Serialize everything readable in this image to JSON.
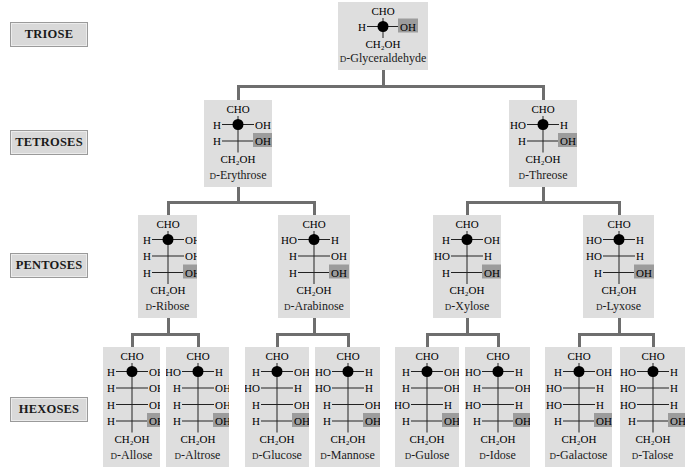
{
  "levels": [
    {
      "label": "TRIOSE",
      "top": 22
    },
    {
      "label": "TETROSES",
      "top": 130
    },
    {
      "label": "PENTOSES",
      "top": 253
    },
    {
      "label": "HEXOSES",
      "top": 397
    }
  ],
  "formula": {
    "top_group": "CHO",
    "bottom_group": "CH2OH",
    "bottom_group_display": "CH₂OH",
    "hydroxyl": "OH",
    "hydrogen": "H",
    "hydroxyl_left": "HO"
  },
  "colors": {
    "box_fill": "#dedede",
    "highlight_fill": "#9c9c9c",
    "connector": "#6e6e6e",
    "label_fill": "#d9d9d9",
    "stereocenter_dot": "#000000"
  },
  "sugars": [
    {
      "id": "glyceraldehyde",
      "prefix": "D",
      "name": "-Glyceraldehyde",
      "level": "TRIOSE",
      "x": 338,
      "y": 2,
      "w": 90,
      "h": 68,
      "carbons": [
        [
          "H",
          "OH"
        ]
      ]
    },
    {
      "id": "erythrose",
      "prefix": "D",
      "name": "-Erythrose",
      "level": "TETROSES",
      "x": 204,
      "y": 100,
      "w": 68,
      "h": 87,
      "carbons": [
        [
          "H",
          "OH"
        ],
        [
          "H",
          "OH"
        ]
      ]
    },
    {
      "id": "threose",
      "prefix": "D",
      "name": "-Threose",
      "level": "TETROSES",
      "x": 509,
      "y": 100,
      "w": 68,
      "h": 87,
      "carbons": [
        [
          "HO",
          "H"
        ],
        [
          "H",
          "OH"
        ]
      ]
    },
    {
      "id": "ribose",
      "prefix": "D",
      "name": "-Ribose",
      "level": "PENTOSES",
      "x": 138,
      "y": 215,
      "w": 59,
      "h": 103,
      "carbons": [
        [
          "H",
          "OH"
        ],
        [
          "H",
          "OH"
        ],
        [
          "H",
          "OH"
        ]
      ]
    },
    {
      "id": "arabinose",
      "prefix": "D",
      "name": "-Arabinose",
      "level": "PENTOSES",
      "x": 278,
      "y": 215,
      "w": 72,
      "h": 103,
      "carbons": [
        [
          "HO",
          "H"
        ],
        [
          "H",
          "OH"
        ],
        [
          "H",
          "OH"
        ]
      ]
    },
    {
      "id": "xylose",
      "prefix": "D",
      "name": "-Xylose",
      "level": "PENTOSES",
      "x": 433,
      "y": 215,
      "w": 68,
      "h": 103,
      "carbons": [
        [
          "H",
          "OH"
        ],
        [
          "HO",
          "H"
        ],
        [
          "H",
          "OH"
        ]
      ]
    },
    {
      "id": "lyxose",
      "prefix": "D",
      "name": "-Lyxose",
      "level": "PENTOSES",
      "x": 583,
      "y": 215,
      "w": 71,
      "h": 103,
      "carbons": [
        [
          "HO",
          "H"
        ],
        [
          "HO",
          "H"
        ],
        [
          "H",
          "OH"
        ]
      ]
    },
    {
      "id": "allose",
      "prefix": "D",
      "name": "-Allose",
      "level": "HEXOSES",
      "x": 103,
      "y": 347,
      "w": 57,
      "h": 120,
      "carbons": [
        [
          "H",
          "OH"
        ],
        [
          "H",
          "OH"
        ],
        [
          "H",
          "OH"
        ],
        [
          "H",
          "OH"
        ]
      ]
    },
    {
      "id": "altrose",
      "prefix": "D",
      "name": "-Altrose",
      "level": "HEXOSES",
      "x": 166,
      "y": 347,
      "w": 63,
      "h": 120,
      "carbons": [
        [
          "HO",
          "H"
        ],
        [
          "H",
          "OH"
        ],
        [
          "H",
          "OH"
        ],
        [
          "H",
          "OH"
        ]
      ]
    },
    {
      "id": "glucose",
      "prefix": "D",
      "name": "-Glucose",
      "level": "HEXOSES",
      "x": 245,
      "y": 347,
      "w": 64,
      "h": 120,
      "carbons": [
        [
          "H",
          "OH"
        ],
        [
          "HO",
          "H"
        ],
        [
          "H",
          "OH"
        ],
        [
          "H",
          "OH"
        ]
      ]
    },
    {
      "id": "mannose",
      "prefix": "D",
      "name": "-Mannose",
      "level": "HEXOSES",
      "x": 315,
      "y": 347,
      "w": 65,
      "h": 120,
      "carbons": [
        [
          "HO",
          "H"
        ],
        [
          "HO",
          "H"
        ],
        [
          "H",
          "OH"
        ],
        [
          "H",
          "OH"
        ]
      ]
    },
    {
      "id": "gulose",
      "prefix": "D",
      "name": "-Gulose",
      "level": "HEXOSES",
      "x": 395,
      "y": 347,
      "w": 64,
      "h": 120,
      "carbons": [
        [
          "H",
          "OH"
        ],
        [
          "H",
          "OH"
        ],
        [
          "HO",
          "H"
        ],
        [
          "H",
          "OH"
        ]
      ]
    },
    {
      "id": "idose",
      "prefix": "D",
      "name": "-Idose",
      "level": "HEXOSES",
      "x": 465,
      "y": 347,
      "w": 65,
      "h": 120,
      "carbons": [
        [
          "HO",
          "H"
        ],
        [
          "H",
          "OH"
        ],
        [
          "HO",
          "H"
        ],
        [
          "H",
          "OH"
        ]
      ]
    },
    {
      "id": "galactose",
      "prefix": "D",
      "name": "-Galactose",
      "level": "HEXOSES",
      "x": 545,
      "y": 347,
      "w": 67,
      "h": 120,
      "carbons": [
        [
          "H",
          "OH"
        ],
        [
          "HO",
          "H"
        ],
        [
          "HO",
          "H"
        ],
        [
          "H",
          "OH"
        ]
      ]
    },
    {
      "id": "talose",
      "prefix": "D",
      "name": "-Talose",
      "level": "HEXOSES",
      "x": 620,
      "y": 347,
      "w": 65,
      "h": 120,
      "carbons": [
        [
          "HO",
          "H"
        ],
        [
          "HO",
          "H"
        ],
        [
          "HO",
          "H"
        ],
        [
          "H",
          "OH"
        ]
      ]
    }
  ],
  "tree": {
    "glyceraldehyde": [
      "erythrose",
      "threose"
    ],
    "erythrose": [
      "ribose",
      "arabinose"
    ],
    "threose": [
      "xylose",
      "lyxose"
    ],
    "ribose": [
      "allose",
      "altrose"
    ],
    "arabinose": [
      "glucose",
      "mannose"
    ],
    "xylose": [
      "gulose",
      "idose"
    ],
    "lyxose": [
      "galactose",
      "talose"
    ]
  }
}
